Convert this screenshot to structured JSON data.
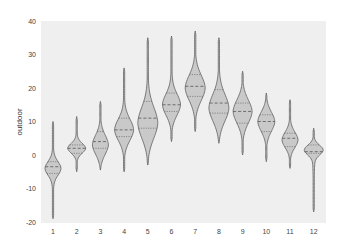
{
  "chart_data": {
    "type": "violin",
    "title": "",
    "xlabel": "",
    "ylabel": "outdoor",
    "ylim": [
      -20,
      40
    ],
    "yticks": [
      40,
      30,
      20,
      10,
      0,
      -10,
      -20
    ],
    "grid": false,
    "legend": null,
    "categories": [
      "1",
      "2",
      "3",
      "4",
      "5",
      "6",
      "7",
      "8",
      "9",
      "10",
      "11",
      "12"
    ],
    "series": [
      {
        "name": "outdoor",
        "violins": [
          {
            "category": "1",
            "min": -19,
            "q1": -5.5,
            "median": -3.5,
            "q3": -2,
            "max": 10,
            "mode": -4,
            "width": 8
          },
          {
            "category": "2",
            "min": -5,
            "q1": 0.5,
            "median": 2,
            "q3": 3,
            "max": 11.5,
            "mode": 2,
            "width": 9
          },
          {
            "category": "3",
            "min": -4.5,
            "q1": 2,
            "median": 4,
            "q3": 7,
            "max": 16,
            "mode": 3,
            "width": 8
          },
          {
            "category": "4",
            "min": -5,
            "q1": 5.5,
            "median": 7.5,
            "q3": 11,
            "max": 26,
            "mode": 7.5,
            "width": 9.5
          },
          {
            "category": "5",
            "min": -3,
            "q1": 8,
            "median": 11,
            "q3": 16,
            "max": 35,
            "mode": 9.5,
            "width": 10
          },
          {
            "category": "6",
            "min": 4,
            "q1": 13,
            "median": 15,
            "q3": 18.5,
            "max": 35.5,
            "mode": 15,
            "width": 9
          },
          {
            "category": "7",
            "min": 7,
            "q1": 17.5,
            "median": 20.5,
            "q3": 24,
            "max": 37,
            "mode": 20,
            "width": 10
          },
          {
            "category": "8",
            "min": 3.5,
            "q1": 12.5,
            "median": 15.5,
            "q3": 19.5,
            "max": 35,
            "mode": 14,
            "width": 10
          },
          {
            "category": "9",
            "min": 0,
            "q1": 9.5,
            "median": 13,
            "q3": 15.5,
            "max": 25,
            "mode": 13,
            "width": 9.5
          },
          {
            "category": "10",
            "min": -2,
            "q1": 7,
            "median": 10,
            "q3": 12,
            "max": 18.5,
            "mode": 10,
            "width": 8.5
          },
          {
            "category": "11",
            "min": -4,
            "q1": 2.5,
            "median": 5,
            "q3": 6.5,
            "max": 16.5,
            "mode": 4.5,
            "width": 8
          },
          {
            "category": "12",
            "min": -17,
            "q1": 0.5,
            "median": 1,
            "q3": 3,
            "max": 8,
            "mode": 1.5,
            "width": 9.5
          }
        ]
      }
    ]
  },
  "colors": {
    "plot_background": "#efefef",
    "violin_fill": "#c9c9c9",
    "violin_edge": "#5f5f5f"
  }
}
